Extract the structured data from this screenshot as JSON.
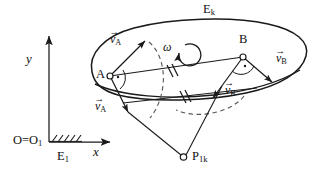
{
  "figure": {
    "type": "kinematics-diagram",
    "background_color": "#ffffff",
    "stroke_color": "#1a1a1a"
  },
  "axes": {
    "y_label": "y",
    "x_label": "x",
    "origin_label": "O=O",
    "origin_sub": "1",
    "ground_frame_label": "E",
    "ground_frame_sub": "1"
  },
  "body": {
    "label": "E",
    "label_sub": "k",
    "omega_label": "ω"
  },
  "points": [
    {
      "name": "A",
      "label": "A"
    },
    {
      "name": "B",
      "label": "B"
    },
    {
      "name": "instant-centre",
      "label": "P",
      "label_sub": "1k"
    }
  ],
  "vectors": [
    {
      "name": "v-a-rotated",
      "base": "v",
      "sub": "A",
      "arrow": "→"
    },
    {
      "name": "v-a",
      "base": "v",
      "sub": "A",
      "arrow": "→"
    },
    {
      "name": "v-b-rotated",
      "base": "v",
      "sub": "B",
      "arrow": "→"
    },
    {
      "name": "v-b",
      "base": "v",
      "sub": "B",
      "arrow": "→"
    }
  ],
  "annotations": {
    "equal_tick_marks": "//",
    "right_angle_marker": "∙"
  }
}
